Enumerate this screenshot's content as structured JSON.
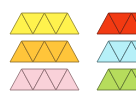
{
  "strips": [
    {
      "name": "yellow",
      "fill": "#fff24d",
      "stroke": "#8a7f2a",
      "x": 10,
      "y": 13,
      "h": 21,
      "w": 23,
      "count": 5
    },
    {
      "name": "orange",
      "fill": "#ffc53a",
      "stroke": "#8a6a25",
      "x": 10,
      "y": 41,
      "h": 21,
      "w": 23,
      "count": 5
    },
    {
      "name": "pink",
      "fill": "#f9d1d9",
      "stroke": "#8a6a70",
      "x": 10,
      "y": 69,
      "h": 21,
      "w": 23,
      "count": 5
    },
    {
      "name": "red",
      "fill": "#f23a12",
      "stroke": "#7a2010",
      "x": 97,
      "y": 13,
      "h": 21,
      "w": 23,
      "count": 4
    },
    {
      "name": "light-blue",
      "fill": "#b6f0f8",
      "stroke": "#4a6a70",
      "x": 97,
      "y": 41,
      "h": 21,
      "w": 23,
      "count": 4
    },
    {
      "name": "green",
      "fill": "#b6dc5c",
      "stroke": "#5a7030",
      "x": 97,
      "y": 69,
      "h": 21,
      "w": 23,
      "count": 4
    }
  ]
}
